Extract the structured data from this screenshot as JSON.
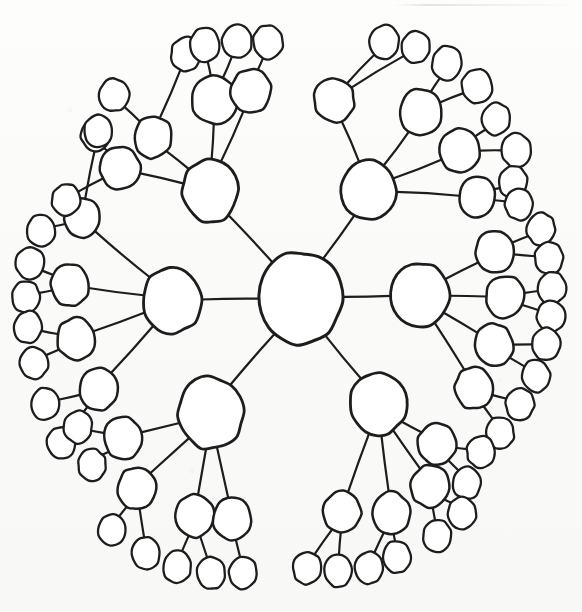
{
  "document": {
    "title": "Hand-drawn radial tree diagram",
    "medium": "pen on paper sketch (scanned)",
    "background_color": "#fbfbfa",
    "ink_color": "#1d1d1d"
  },
  "chart_data": {
    "type": "diagram",
    "subtype": "radial tree / node-link graph",
    "title": "",
    "node_count": 94,
    "edge_count": 93,
    "depth_levels": 4,
    "root_degree": 6,
    "style": {
      "node_shape": "hand-drawn ellipse",
      "node_fill": "#ffffff",
      "stroke_color": "#1d1d1d",
      "root_stroke_width": 3.0,
      "hub_stroke_width": 2.8,
      "mid_stroke_width": 2.5,
      "leaf_stroke_width": 2.3,
      "edge_stroke_width": 2.2,
      "labels": "none"
    },
    "canvas": {
      "width": 582,
      "height": 612
    },
    "nodes": [
      {
        "id": "root",
        "level": 0,
        "cx": 300,
        "cy": 298,
        "rx": 42,
        "ry": 46,
        "rot": 4
      },
      {
        "id": "h-tl",
        "level": 1,
        "cx": 210,
        "cy": 191,
        "rx": 28,
        "ry": 31,
        "rot": -6
      },
      {
        "id": "h-tr",
        "level": 1,
        "cx": 369,
        "cy": 190,
        "rx": 27,
        "ry": 30,
        "rot": 7
      },
      {
        "id": "h-l",
        "level": 1,
        "cx": 172,
        "cy": 300,
        "rx": 29,
        "ry": 33,
        "rot": -3
      },
      {
        "id": "h-r",
        "level": 1,
        "cx": 420,
        "cy": 295,
        "rx": 29,
        "ry": 32,
        "rot": 5
      },
      {
        "id": "h-bl",
        "level": 1,
        "cx": 211,
        "cy": 413,
        "rx": 32,
        "ry": 36,
        "rot": -5
      },
      {
        "id": "h-br",
        "level": 1,
        "cx": 378,
        "cy": 404,
        "rx": 28,
        "ry": 31,
        "rot": 3
      },
      {
        "id": "m-tl-1",
        "level": 2,
        "cx": 120,
        "cy": 168,
        "rx": 20,
        "ry": 21,
        "rot": -8
      },
      {
        "id": "m-tl-2",
        "level": 2,
        "cx": 153,
        "cy": 137,
        "rx": 19,
        "ry": 21,
        "rot": 6
      },
      {
        "id": "m-tl-3",
        "level": 2,
        "cx": 215,
        "cy": 100,
        "rx": 23,
        "ry": 24,
        "rot": -4
      },
      {
        "id": "m-tl-4",
        "level": 2,
        "cx": 251,
        "cy": 91,
        "rx": 20,
        "ry": 22,
        "rot": 9
      },
      {
        "id": "m-tr-1",
        "level": 2,
        "cx": 334,
        "cy": 100,
        "rx": 20,
        "ry": 22,
        "rot": -7
      },
      {
        "id": "m-tr-2",
        "level": 2,
        "cx": 421,
        "cy": 112,
        "rx": 21,
        "ry": 23,
        "rot": 4
      },
      {
        "id": "m-tr-3",
        "level": 2,
        "cx": 460,
        "cy": 151,
        "rx": 20,
        "ry": 22,
        "rot": -5
      },
      {
        "id": "m-tr-4",
        "level": 2,
        "cx": 477,
        "cy": 197,
        "rx": 18,
        "ry": 20,
        "rot": 8
      },
      {
        "id": "m-l-1",
        "level": 2,
        "cx": 82,
        "cy": 218,
        "rx": 18,
        "ry": 20,
        "rot": -6
      },
      {
        "id": "m-l-2",
        "level": 2,
        "cx": 70,
        "cy": 285,
        "rx": 19,
        "ry": 21,
        "rot": 5
      },
      {
        "id": "m-l-3",
        "level": 2,
        "cx": 76,
        "cy": 339,
        "rx": 19,
        "ry": 21,
        "rot": -4
      },
      {
        "id": "m-l-4",
        "level": 2,
        "cx": 99,
        "cy": 389,
        "rx": 19,
        "ry": 21,
        "rot": 7
      },
      {
        "id": "m-r-1",
        "level": 2,
        "cx": 495,
        "cy": 252,
        "rx": 19,
        "ry": 21,
        "rot": -5
      },
      {
        "id": "m-r-2",
        "level": 2,
        "cx": 505,
        "cy": 297,
        "rx": 19,
        "ry": 21,
        "rot": 6
      },
      {
        "id": "m-r-3",
        "level": 2,
        "cx": 494,
        "cy": 345,
        "rx": 19,
        "ry": 21,
        "rot": -7
      },
      {
        "id": "m-r-4",
        "level": 2,
        "cx": 474,
        "cy": 388,
        "rx": 19,
        "ry": 21,
        "rot": 4
      },
      {
        "id": "m-bl-1",
        "level": 2,
        "cx": 123,
        "cy": 438,
        "rx": 19,
        "ry": 21,
        "rot": -6
      },
      {
        "id": "m-bl-2",
        "level": 2,
        "cx": 137,
        "cy": 488,
        "rx": 19,
        "ry": 21,
        "rot": 5
      },
      {
        "id": "m-bl-3",
        "level": 2,
        "cx": 195,
        "cy": 516,
        "rx": 19,
        "ry": 21,
        "rot": -4
      },
      {
        "id": "m-bl-4",
        "level": 2,
        "cx": 232,
        "cy": 519,
        "rx": 19,
        "ry": 21,
        "rot": 8
      },
      {
        "id": "m-br-1",
        "level": 2,
        "cx": 437,
        "cy": 444,
        "rx": 19,
        "ry": 21,
        "rot": -5
      },
      {
        "id": "m-br-2",
        "level": 2,
        "cx": 430,
        "cy": 486,
        "rx": 19,
        "ry": 21,
        "rot": 6
      },
      {
        "id": "m-br-3",
        "level": 2,
        "cx": 391,
        "cy": 513,
        "rx": 19,
        "ry": 21,
        "rot": -6
      },
      {
        "id": "m-br-4",
        "level": 2,
        "cx": 342,
        "cy": 512,
        "rx": 19,
        "ry": 21,
        "rot": 4
      },
      {
        "id": "l-tl-1a",
        "level": 3,
        "cx": 95,
        "cy": 135,
        "rx": 14,
        "ry": 16,
        "rot": -9
      },
      {
        "id": "l-tl-1b",
        "level": 3,
        "cx": 66,
        "cy": 200,
        "rx": 14,
        "ry": 16,
        "rot": 6
      },
      {
        "id": "l-tl-2a",
        "level": 3,
        "cx": 114,
        "cy": 95,
        "rx": 15,
        "ry": 16,
        "rot": -5
      },
      {
        "id": "l-tl-2b",
        "level": 3,
        "cx": 186,
        "cy": 54,
        "rx": 15,
        "ry": 17,
        "rot": 8
      },
      {
        "id": "l-tl-3a",
        "level": 3,
        "cx": 205,
        "cy": 45,
        "rx": 15,
        "ry": 17,
        "rot": -7
      },
      {
        "id": "l-tl-3b",
        "level": 3,
        "cx": 237,
        "cy": 41,
        "rx": 15,
        "ry": 17,
        "rot": 5
      },
      {
        "id": "l-tl-4a",
        "level": 3,
        "cx": 268,
        "cy": 42,
        "rx": 15,
        "ry": 17,
        "rot": -6
      },
      {
        "id": "l-tr-1a",
        "level": 3,
        "cx": 384,
        "cy": 42,
        "rx": 15,
        "ry": 17,
        "rot": 7
      },
      {
        "id": "l-tr-1b",
        "level": 3,
        "cx": 416,
        "cy": 47,
        "rx": 14,
        "ry": 16,
        "rot": -5
      },
      {
        "id": "l-tr-2a",
        "level": 3,
        "cx": 447,
        "cy": 63,
        "rx": 15,
        "ry": 17,
        "rot": 6
      },
      {
        "id": "l-tr-2b",
        "level": 3,
        "cx": 477,
        "cy": 86,
        "rx": 15,
        "ry": 17,
        "rot": -8
      },
      {
        "id": "l-tr-3a",
        "level": 3,
        "cx": 496,
        "cy": 119,
        "rx": 14,
        "ry": 16,
        "rot": 5
      },
      {
        "id": "l-tr-3b",
        "level": 3,
        "cx": 516,
        "cy": 150,
        "rx": 15,
        "ry": 17,
        "rot": -6
      },
      {
        "id": "l-tr-4a",
        "level": 3,
        "cx": 513,
        "cy": 182,
        "rx": 14,
        "ry": 16,
        "rot": 7
      },
      {
        "id": "l-tr-4b",
        "level": 3,
        "cx": 519,
        "cy": 204,
        "rx": 14,
        "ry": 16,
        "rot": -4
      },
      {
        "id": "l-l-1a",
        "level": 3,
        "cx": 98,
        "cy": 131,
        "rx": 14,
        "ry": 16,
        "rot": 5
      },
      {
        "id": "l-l-1b",
        "level": 3,
        "cx": 41,
        "cy": 231,
        "rx": 14,
        "ry": 16,
        "rot": -7
      },
      {
        "id": "l-l-2a",
        "level": 3,
        "cx": 30,
        "cy": 263,
        "rx": 14,
        "ry": 16,
        "rot": 6
      },
      {
        "id": "l-l-2b",
        "level": 3,
        "cx": 26,
        "cy": 297,
        "rx": 14,
        "ry": 16,
        "rot": -5
      },
      {
        "id": "l-l-3a",
        "level": 3,
        "cx": 28,
        "cy": 327,
        "rx": 14,
        "ry": 16,
        "rot": 8
      },
      {
        "id": "l-l-3b",
        "level": 3,
        "cx": 34,
        "cy": 363,
        "rx": 14,
        "ry": 16,
        "rot": -6
      },
      {
        "id": "l-l-4a",
        "level": 3,
        "cx": 45,
        "cy": 404,
        "rx": 14,
        "ry": 16,
        "rot": 5
      },
      {
        "id": "l-l-4b",
        "level": 3,
        "cx": 61,
        "cy": 443,
        "rx": 14,
        "ry": 16,
        "rot": -7
      },
      {
        "id": "l-r-1a",
        "level": 3,
        "cx": 541,
        "cy": 229,
        "rx": 14,
        "ry": 16,
        "rot": 6
      },
      {
        "id": "l-r-1b",
        "level": 3,
        "cx": 549,
        "cy": 258,
        "rx": 14,
        "ry": 16,
        "rot": -5
      },
      {
        "id": "l-r-2a",
        "level": 3,
        "cx": 552,
        "cy": 288,
        "rx": 14,
        "ry": 16,
        "rot": 7
      },
      {
        "id": "l-r-2b",
        "level": 3,
        "cx": 551,
        "cy": 316,
        "rx": 14,
        "ry": 16,
        "rot": -6
      },
      {
        "id": "l-r-3a",
        "level": 3,
        "cx": 546,
        "cy": 344,
        "rx": 14,
        "ry": 16,
        "rot": 5
      },
      {
        "id": "l-r-3b",
        "level": 3,
        "cx": 536,
        "cy": 376,
        "rx": 14,
        "ry": 16,
        "rot": -8
      },
      {
        "id": "l-r-4a",
        "level": 3,
        "cx": 520,
        "cy": 404,
        "rx": 14,
        "ry": 16,
        "rot": 6
      },
      {
        "id": "l-r-4b",
        "level": 3,
        "cx": 500,
        "cy": 433,
        "rx": 14,
        "ry": 16,
        "rot": -5
      },
      {
        "id": "l-bl-1a",
        "level": 3,
        "cx": 78,
        "cy": 427,
        "rx": 14,
        "ry": 16,
        "rot": 7
      },
      {
        "id": "l-bl-1b",
        "level": 3,
        "cx": 92,
        "cy": 465,
        "rx": 14,
        "ry": 16,
        "rot": -6
      },
      {
        "id": "l-bl-2a",
        "level": 3,
        "cx": 112,
        "cy": 530,
        "rx": 14,
        "ry": 16,
        "rot": 5
      },
      {
        "id": "l-bl-2b",
        "level": 3,
        "cx": 146,
        "cy": 553,
        "rx": 14,
        "ry": 16,
        "rot": -7
      },
      {
        "id": "l-bl-3a",
        "level": 3,
        "cx": 177,
        "cy": 567,
        "rx": 14,
        "ry": 16,
        "rot": 6
      },
      {
        "id": "l-bl-3b",
        "level": 3,
        "cx": 211,
        "cy": 573,
        "rx": 14,
        "ry": 16,
        "rot": -5
      },
      {
        "id": "l-bl-4a",
        "level": 3,
        "cx": 243,
        "cy": 573,
        "rx": 14,
        "ry": 16,
        "rot": 8
      },
      {
        "id": "l-br-1a",
        "level": 3,
        "cx": 481,
        "cy": 452,
        "rx": 14,
        "ry": 16,
        "rot": -6
      },
      {
        "id": "l-br-1b",
        "level": 3,
        "cx": 467,
        "cy": 483,
        "rx": 14,
        "ry": 16,
        "rot": 5
      },
      {
        "id": "l-br-2a",
        "level": 3,
        "cx": 462,
        "cy": 513,
        "rx": 14,
        "ry": 16,
        "rot": -7
      },
      {
        "id": "l-br-2b",
        "level": 3,
        "cx": 437,
        "cy": 536,
        "rx": 14,
        "ry": 16,
        "rot": 6
      },
      {
        "id": "l-br-3a",
        "level": 3,
        "cx": 397,
        "cy": 557,
        "rx": 14,
        "ry": 16,
        "rot": -5
      },
      {
        "id": "l-br-3b",
        "level": 3,
        "cx": 369,
        "cy": 568,
        "rx": 14,
        "ry": 16,
        "rot": 7
      },
      {
        "id": "l-br-4a",
        "level": 3,
        "cx": 338,
        "cy": 571,
        "rx": 14,
        "ry": 16,
        "rot": -6
      },
      {
        "id": "l-br-4b",
        "level": 3,
        "cx": 307,
        "cy": 568,
        "rx": 14,
        "ry": 16,
        "rot": 5
      }
    ],
    "edges": [
      [
        "root",
        "h-tl"
      ],
      [
        "root",
        "h-tr"
      ],
      [
        "root",
        "h-l"
      ],
      [
        "root",
        "h-r"
      ],
      [
        "root",
        "h-bl"
      ],
      [
        "root",
        "h-br"
      ],
      [
        "h-tl",
        "m-tl-1"
      ],
      [
        "h-tl",
        "m-tl-2"
      ],
      [
        "h-tl",
        "m-tl-3"
      ],
      [
        "h-tl",
        "m-tl-4"
      ],
      [
        "m-tl-1",
        "l-tl-1a"
      ],
      [
        "m-tl-1",
        "l-tl-1b"
      ],
      [
        "m-tl-2",
        "l-tl-2a"
      ],
      [
        "m-tl-2",
        "l-tl-2b"
      ],
      [
        "m-tl-3",
        "l-tl-3a"
      ],
      [
        "m-tl-3",
        "l-tl-3b"
      ],
      [
        "m-tl-4",
        "l-tl-4a"
      ],
      [
        "h-tr",
        "m-tr-1"
      ],
      [
        "h-tr",
        "m-tr-2"
      ],
      [
        "h-tr",
        "m-tr-3"
      ],
      [
        "h-tr",
        "m-tr-4"
      ],
      [
        "m-tr-1",
        "l-tr-1a"
      ],
      [
        "m-tr-1",
        "l-tr-1b"
      ],
      [
        "m-tr-2",
        "l-tr-2a"
      ],
      [
        "m-tr-2",
        "l-tr-2b"
      ],
      [
        "m-tr-3",
        "l-tr-3a"
      ],
      [
        "m-tr-3",
        "l-tr-3b"
      ],
      [
        "m-tr-4",
        "l-tr-4a"
      ],
      [
        "m-tr-4",
        "l-tr-4b"
      ],
      [
        "h-l",
        "m-l-1"
      ],
      [
        "h-l",
        "m-l-2"
      ],
      [
        "h-l",
        "m-l-3"
      ],
      [
        "h-l",
        "m-l-4"
      ],
      [
        "m-l-1",
        "l-l-1a"
      ],
      [
        "m-l-1",
        "l-l-1b"
      ],
      [
        "m-l-2",
        "l-l-2a"
      ],
      [
        "m-l-2",
        "l-l-2b"
      ],
      [
        "m-l-3",
        "l-l-3a"
      ],
      [
        "m-l-3",
        "l-l-3b"
      ],
      [
        "m-l-4",
        "l-l-4a"
      ],
      [
        "m-l-4",
        "l-l-4b"
      ],
      [
        "h-r",
        "m-r-1"
      ],
      [
        "h-r",
        "m-r-2"
      ],
      [
        "h-r",
        "m-r-3"
      ],
      [
        "h-r",
        "m-r-4"
      ],
      [
        "m-r-1",
        "l-r-1a"
      ],
      [
        "m-r-1",
        "l-r-1b"
      ],
      [
        "m-r-2",
        "l-r-2a"
      ],
      [
        "m-r-2",
        "l-r-2b"
      ],
      [
        "m-r-3",
        "l-r-3a"
      ],
      [
        "m-r-3",
        "l-r-3b"
      ],
      [
        "m-r-4",
        "l-r-4a"
      ],
      [
        "m-r-4",
        "l-r-4b"
      ],
      [
        "h-bl",
        "m-bl-1"
      ],
      [
        "h-bl",
        "m-bl-2"
      ],
      [
        "h-bl",
        "m-bl-3"
      ],
      [
        "h-bl",
        "m-bl-4"
      ],
      [
        "m-bl-1",
        "l-bl-1a"
      ],
      [
        "m-bl-1",
        "l-bl-1b"
      ],
      [
        "m-bl-2",
        "l-bl-2a"
      ],
      [
        "m-bl-2",
        "l-bl-2b"
      ],
      [
        "m-bl-3",
        "l-bl-3a"
      ],
      [
        "m-bl-3",
        "l-bl-3b"
      ],
      [
        "m-bl-4",
        "l-bl-4a"
      ],
      [
        "h-br",
        "m-br-1"
      ],
      [
        "h-br",
        "m-br-2"
      ],
      [
        "h-br",
        "m-br-3"
      ],
      [
        "h-br",
        "m-br-4"
      ],
      [
        "m-br-1",
        "l-br-1a"
      ],
      [
        "m-br-1",
        "l-br-1b"
      ],
      [
        "m-br-2",
        "l-br-2a"
      ],
      [
        "m-br-2",
        "l-br-2b"
      ],
      [
        "m-br-3",
        "l-br-3a"
      ],
      [
        "m-br-3",
        "l-br-3b"
      ],
      [
        "m-br-4",
        "l-br-4a"
      ],
      [
        "m-br-4",
        "l-br-4b"
      ]
    ]
  }
}
